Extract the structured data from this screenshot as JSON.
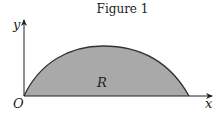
{
  "figure": {
    "title": "Figure 1",
    "axes": {
      "x_label": "x",
      "y_label": "y",
      "origin_label": "O"
    },
    "region_label": "R",
    "colors": {
      "region_fill": "#a9a9a9",
      "curve": "#333333",
      "axis": "#222222"
    }
  }
}
